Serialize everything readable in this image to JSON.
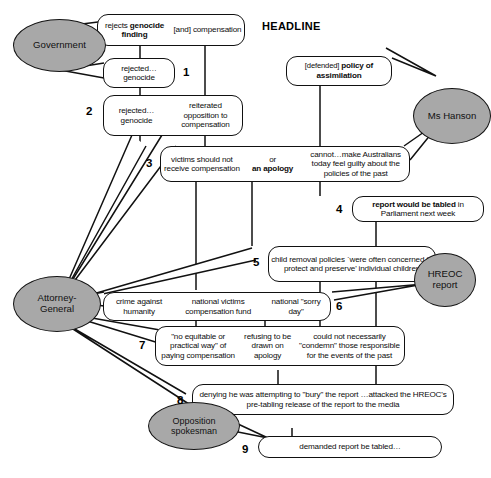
{
  "diagram": {
    "headline_label": "HEADLINE",
    "actors": [
      {
        "name": "government",
        "label": "Government"
      },
      {
        "name": "ms-hanson",
        "label": "Ms Hanson"
      },
      {
        "name": "attorney-general",
        "label": "Attorney-\nGeneral"
      },
      {
        "name": "hreoc-report",
        "label": "HREOC\nreport"
      },
      {
        "name": "opposition-spokesman",
        "label": "Opposition\nspokesman"
      }
    ],
    "row_numbers": [
      "1",
      "2",
      "3",
      "4",
      "5",
      "6",
      "7",
      "8",
      "9"
    ],
    "rows": [
      {
        "number": "1",
        "boxes": [
          {
            "name": "box-rejects-genocide-finding",
            "cells": [
              {
                "plain_before": "rejects ",
                "bold": "genocide finding",
                "plain_after": ""
              },
              {
                "plain_before": "[and] ",
                "bold": "",
                "plain_after": "compensation"
              }
            ]
          },
          {
            "name": "box-rejected-genocide-a",
            "cells": [
              {
                "plain_before": "rejected… genocide",
                "bold": "",
                "plain_after": ""
              }
            ]
          }
        ]
      },
      {
        "number": "2",
        "boxes": [
          {
            "name": "box-rejected-genocide-reiterated",
            "cells": [
              {
                "plain_before": "rejected… genocide",
                "bold": "",
                "plain_after": ""
              },
              {
                "plain_before": "reiterated opposition to compensation",
                "bold": "",
                "plain_after": ""
              }
            ]
          }
        ]
      },
      {
        "number": "3",
        "boxes": [
          {
            "name": "box-victims-apology-guilty",
            "cells": [
              {
                "plain_before": "victims should not receive compensation",
                "bold": "",
                "plain_after": ""
              },
              {
                "plain_before": "or ",
                "bold": "an apology",
                "plain_after": ""
              },
              {
                "plain_before": "cannot…make Australians today feel guilty about the policies of the past",
                "bold": "",
                "plain_after": ""
              }
            ]
          }
        ]
      },
      {
        "number": "4",
        "boxes": [
          {
            "name": "box-report-tabled-parliament",
            "cells": [
              {
                "plain_before": "",
                "bold": "report would be tabled",
                "plain_after": " in Parliament next week"
              }
            ]
          }
        ]
      },
      {
        "number": "5",
        "boxes": [
          {
            "name": "box-child-removal-policies",
            "cells": [
              {
                "plain_before": "child removal policies `were often concerned to protect and preserve' individual children",
                "bold": "",
                "plain_after": ""
              }
            ]
          }
        ]
      },
      {
        "number": "6",
        "boxes": [
          {
            "name": "box-crime-fund-sorry-day",
            "cells": [
              {
                "plain_before": "crime against humanity",
                "bold": "",
                "plain_after": ""
              },
              {
                "plain_before": "national victims compensation fund",
                "bold": "",
                "plain_after": ""
              },
              {
                "plain_before": "national \"sorry day\"",
                "bold": "",
                "plain_after": ""
              }
            ]
          }
        ]
      },
      {
        "number": "7",
        "boxes": [
          {
            "name": "box-no-equitable-way",
            "cells": [
              {
                "plain_before": "\"no equitable or practical way\" of paying compensation",
                "bold": "",
                "plain_after": ""
              },
              {
                "plain_before": "refusing to be drawn on apology",
                "bold": "",
                "plain_after": ""
              },
              {
                "plain_before": "could not necessarily \"condemn\" those responsible for the events of the past",
                "bold": "",
                "plain_after": ""
              }
            ]
          }
        ]
      },
      {
        "number": "8",
        "boxes": [
          {
            "name": "box-denying-bury-report",
            "cells": [
              {
                "plain_before": "denying he was attempting to \"bury\" the report …attacked the HREOC's pre-tabling release of the report to the media",
                "bold": "",
                "plain_after": ""
              }
            ]
          }
        ]
      },
      {
        "number": "9",
        "boxes": [
          {
            "name": "box-demanded-report-tabled",
            "cells": [
              {
                "plain_before": "demanded report be tabled…",
                "bold": "",
                "plain_after": ""
              }
            ]
          }
        ]
      }
    ],
    "colors": {
      "actor_fill": "#a8a8a8",
      "stroke": "#111111",
      "background": "#ffffff"
    }
  }
}
